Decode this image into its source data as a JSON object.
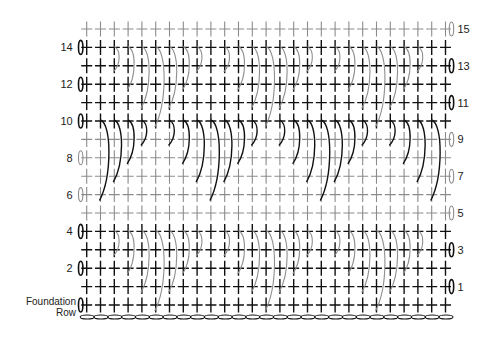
{
  "diagram": {
    "type": "crochet-stitch-chart",
    "columns": 27,
    "grid": {
      "x0": 86.7,
      "dx": 13.8,
      "y_top_row": 29,
      "dy": 18.4
    },
    "colors": {
      "dark": "#111111",
      "light": "#8c8c8c",
      "arc_light": "#8f8f8f",
      "arc_dark": "#111111"
    },
    "rows": [
      {
        "n": 15,
        "side": "right",
        "tone": "light",
        "label": "15"
      },
      {
        "n": 14,
        "side": "left",
        "tone": "dark",
        "label": "14"
      },
      {
        "n": 13,
        "side": "right",
        "tone": "dark",
        "label": "13"
      },
      {
        "n": 12,
        "side": "left",
        "tone": "dark",
        "label": "12"
      },
      {
        "n": 11,
        "side": "right",
        "tone": "dark",
        "label": "11"
      },
      {
        "n": 10,
        "side": "left",
        "tone": "dark",
        "label": "10"
      },
      {
        "n": 9,
        "side": "right",
        "tone": "light",
        "label": "9"
      },
      {
        "n": 8,
        "side": "left",
        "tone": "light",
        "label": "8"
      },
      {
        "n": 7,
        "side": "right",
        "tone": "light",
        "label": "7"
      },
      {
        "n": 6,
        "side": "left",
        "tone": "light",
        "label": "6"
      },
      {
        "n": 5,
        "side": "right",
        "tone": "light",
        "label": "5"
      },
      {
        "n": 4,
        "side": "left",
        "tone": "dark",
        "label": "4"
      },
      {
        "n": 3,
        "side": "right",
        "tone": "dark",
        "label": "3"
      },
      {
        "n": 2,
        "side": "left",
        "tone": "dark",
        "label": "2"
      },
      {
        "n": 1,
        "side": "right",
        "tone": "dark",
        "label": "1"
      },
      {
        "n": 0,
        "side": "left",
        "tone": "dark",
        "label": ""
      }
    ],
    "foundation_label": {
      "line1": "Foundation",
      "line2": "Row"
    },
    "post_stitch_bands": [
      {
        "start_row": 14,
        "tone": "arc_light",
        "lengths": {
          "2": 1,
          "3": 2,
          "4": 3,
          "5": 4,
          "6": 3,
          "7": 2,
          "8": 1,
          "10": 1,
          "11": 2,
          "12": 3,
          "13": 4,
          "14": 3,
          "15": 2,
          "16": 1,
          "18": 1,
          "19": 2,
          "20": 3,
          "21": 4,
          "22": 3,
          "23": 2,
          "24": 1
        }
      },
      {
        "start_row": 10,
        "tone": "arc_dark",
        "lengths": {
          "1": 4,
          "2": 3,
          "3": 2,
          "4": 1,
          "6": 1,
          "7": 2,
          "8": 3,
          "9": 4,
          "10": 3,
          "11": 2,
          "12": 1,
          "14": 1,
          "15": 2,
          "16": 3,
          "17": 4,
          "18": 3,
          "19": 2,
          "20": 1,
          "22": 1,
          "23": 2,
          "24": 3,
          "25": 4
        }
      },
      {
        "start_row": 4,
        "tone": "arc_light",
        "lengths": {
          "2": 1,
          "3": 2,
          "4": 3,
          "5": 4,
          "6": 3,
          "7": 2,
          "8": 1,
          "10": 1,
          "11": 2,
          "12": 3,
          "13": 4,
          "14": 3,
          "15": 2,
          "16": 1,
          "18": 1,
          "19": 2,
          "20": 3,
          "21": 4,
          "22": 3,
          "23": 2,
          "24": 1
        }
      }
    ],
    "chain_count": 27
  }
}
